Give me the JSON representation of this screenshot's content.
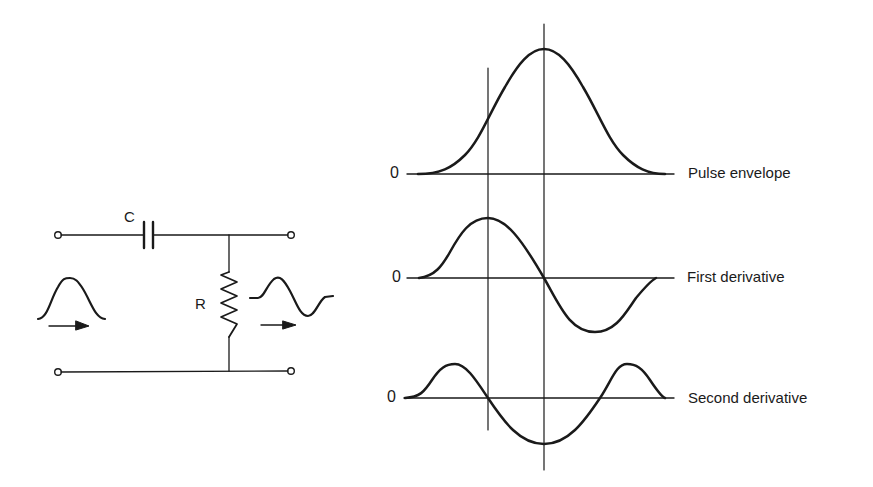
{
  "circuit": {
    "capacitor_label": "C",
    "resistor_label": "R",
    "input_signal": "bell-shaped pulse",
    "output_signal": "differentiated pulse",
    "input_arrow": "arrow-right",
    "output_arrow": "arrow-right"
  },
  "waveforms": [
    {
      "zero_label": "0",
      "label": "Pulse envelope"
    },
    {
      "zero_label": "0",
      "label": "First derivative"
    },
    {
      "zero_label": "0",
      "label": "Second derivative"
    }
  ],
  "colors": {
    "ink": "#1a1a1a",
    "background": "#ffffff"
  }
}
